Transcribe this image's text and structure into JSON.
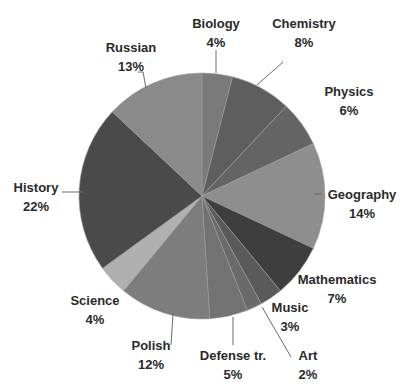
{
  "chart_data": {
    "type": "pie",
    "title": "",
    "start_angle_deg": 0,
    "direction": "clockwise",
    "center": [
      202,
      196
    ],
    "radius": 123,
    "slices": [
      {
        "label": "Biology",
        "value": 4,
        "pct": "4%",
        "color": "#7a7a7a",
        "label_pos": [
          216,
          14
        ],
        "leader": [
          [
            216,
            50
          ],
          [
            216,
            73
          ]
        ]
      },
      {
        "label": "Chemistry",
        "value": 8,
        "pct": "8%",
        "color": "#5e5e5e",
        "label_pos": [
          304,
          14
        ],
        "leader": [
          [
            283,
            62
          ],
          [
            257,
            85
          ]
        ]
      },
      {
        "label": "Physics",
        "value": 6,
        "pct": "6%",
        "color": "#646464",
        "label_pos": [
          349,
          82
        ],
        "leader": []
      },
      {
        "label": "Geography",
        "value": 14,
        "pct": "14%",
        "color": "#8e8e8e",
        "label_pos": [
          362,
          185
        ],
        "leader": [
          [
            322,
            194
          ],
          [
            314,
            194
          ]
        ]
      },
      {
        "label": "Mathematics",
        "value": 7,
        "pct": "7%",
        "color": "#3e3e3e",
        "label_pos": [
          337,
          270
        ],
        "leader": []
      },
      {
        "label": "Music",
        "value": 3,
        "pct": "3%",
        "color": "#5a5a5a",
        "label_pos": [
          290,
          298
        ],
        "leader": []
      },
      {
        "label": "Art",
        "value": 2,
        "pct": "2%",
        "color": "#6a6a6a",
        "label_pos": [
          308,
          346
        ],
        "leader": [
          [
            291,
            357
          ],
          [
            262,
            307
          ]
        ]
      },
      {
        "label": "Defense tr.",
        "value": 5,
        "pct": "5%",
        "color": "#727272",
        "label_pos": [
          233,
          346
        ],
        "leader": [
          [
            233,
            345
          ],
          [
            233,
            317
          ]
        ]
      },
      {
        "label": "Polish",
        "value": 12,
        "pct": "12%",
        "color": "#7d7d7d",
        "label_pos": [
          151,
          336
        ],
        "leader": [
          [
            171,
            345
          ],
          [
            173,
            314
          ]
        ]
      },
      {
        "label": "Science",
        "value": 4,
        "pct": "4%",
        "color": "#b0b0b0",
        "label_pos": [
          95,
          291
        ],
        "leader": []
      },
      {
        "label": "History",
        "value": 22,
        "pct": "22%",
        "color": "#4a4a4a",
        "label_pos": [
          36,
          178
        ],
        "leader": [
          [
            62,
            192
          ],
          [
            83,
            192
          ]
        ]
      },
      {
        "label": "Russian",
        "value": 13,
        "pct": "13%",
        "color": "#8a8a8a",
        "label_pos": [
          131,
          38
        ],
        "leader": [
          [
            138,
            72
          ],
          [
            143,
            72
          ],
          [
            146,
            88
          ]
        ]
      }
    ],
    "legend": "none",
    "grid": false
  }
}
